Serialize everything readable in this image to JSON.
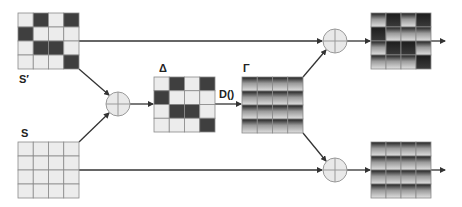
{
  "labels": {
    "s_prime": "S′",
    "s": "S",
    "delta": "Δ",
    "gamma": "Γ",
    "d_func": "D()"
  },
  "matrices": {
    "s_prime": {
      "pattern": [
        [
          0,
          1,
          0,
          1
        ],
        [
          1,
          0,
          0,
          0
        ],
        [
          0,
          1,
          1,
          0
        ],
        [
          0,
          0,
          0,
          1
        ]
      ],
      "style": "binary"
    },
    "s": {
      "pattern": [
        [
          0,
          0,
          0,
          0
        ],
        [
          0,
          0,
          0,
          0
        ],
        [
          0,
          0,
          0,
          0
        ],
        [
          0,
          0,
          0,
          0
        ]
      ],
      "style": "binary"
    },
    "delta": {
      "pattern": [
        [
          0,
          1,
          0,
          1
        ],
        [
          1,
          0,
          0,
          0
        ],
        [
          0,
          1,
          1,
          0
        ],
        [
          0,
          0,
          0,
          1
        ]
      ],
      "style": "binary"
    },
    "gamma": {
      "pattern": [
        [
          0,
          0,
          0,
          0
        ],
        [
          0,
          0,
          0,
          0
        ],
        [
          0,
          0,
          0,
          0
        ],
        [
          0,
          0,
          0,
          0
        ]
      ],
      "style": "gradient"
    },
    "out_top": {
      "pattern": [
        [
          0,
          1,
          0,
          1
        ],
        [
          1,
          0,
          0,
          0
        ],
        [
          0,
          1,
          1,
          0
        ],
        [
          0,
          0,
          0,
          1
        ]
      ],
      "style": "gradient"
    },
    "out_bottom": {
      "pattern": [
        [
          0,
          0,
          0,
          0
        ],
        [
          0,
          0,
          0,
          0
        ],
        [
          0,
          0,
          0,
          0
        ],
        [
          0,
          0,
          0,
          0
        ]
      ],
      "style": "gradient"
    }
  },
  "operators": {
    "add_1": "sum-node",
    "add_top": "sum-node",
    "add_bottom": "sum-node"
  },
  "colors": {
    "dark_cell": "#3f3f3f",
    "light_cell": "#ececec",
    "grid_line": "#8a8a8a",
    "arrow": "#333333",
    "node_fill": "#e9e9e9",
    "node_stroke": "#999999"
  }
}
